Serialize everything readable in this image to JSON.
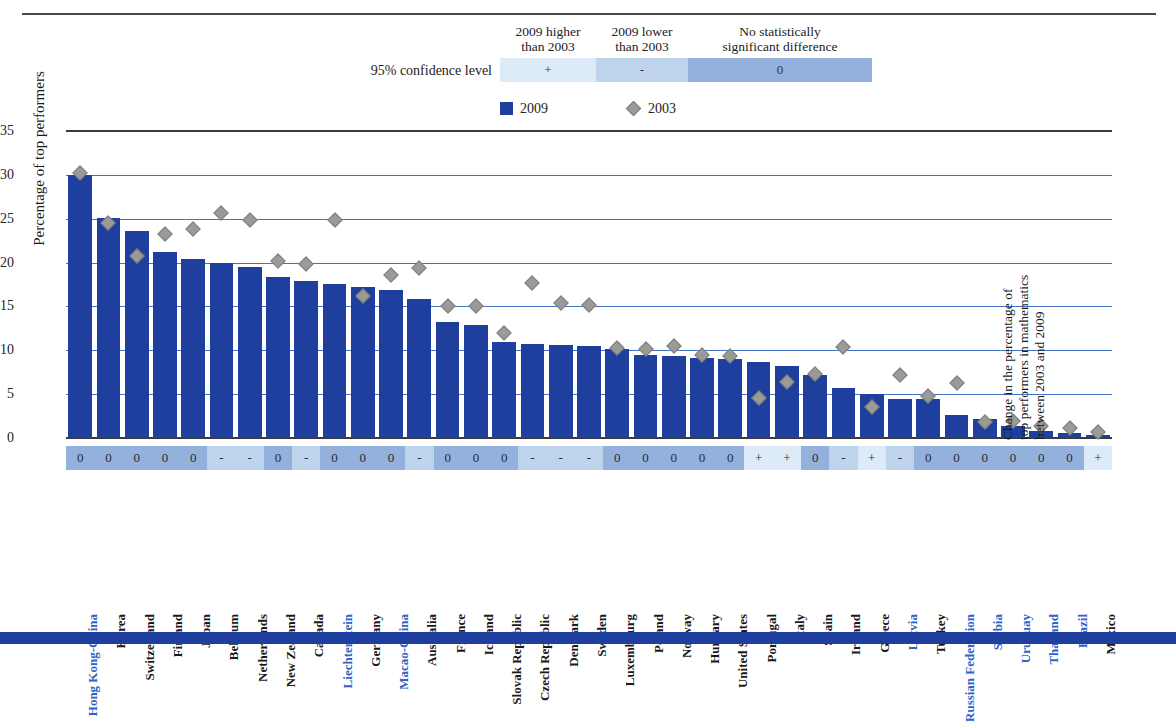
{
  "significance_key": {
    "row_label": "95% confidence level",
    "headers": [
      {
        "line1": "2009 higher",
        "line2": "than 2003"
      },
      {
        "line1": "2009 lower",
        "line2": "than 2003"
      },
      {
        "line1": "No statistically",
        "line2": "significant difference"
      }
    ],
    "bands": [
      {
        "symbol": "+",
        "color": "#dcebf7"
      },
      {
        "symbol": "-",
        "color": "#bed4ec"
      },
      {
        "symbol": "0",
        "color": "#94b0dd"
      }
    ]
  },
  "series_legend": [
    {
      "label": "2009",
      "marker": "square",
      "color": "#1f3f9e"
    },
    {
      "label": "2003",
      "marker": "diamond",
      "color": "#9a9a96"
    }
  ],
  "axes": {
    "y_title": "Percentage of top performers",
    "y_ticks": [
      0,
      5,
      10,
      15,
      20,
      25,
      30,
      35
    ],
    "y_min": 0,
    "y_max": 35,
    "right_title_line1": "Change in the percentage of",
    "right_title_line2": "top performers in mathematics",
    "right_title_line3": "between 2003 and 2009"
  },
  "chart_data": {
    "type": "bar",
    "title": "",
    "xlabel": "",
    "ylabel": "Percentage of top performers",
    "ylim": [
      0,
      35
    ],
    "grid": true,
    "legend_position": "top",
    "categories": [
      "Hong Kong-China",
      "Korea",
      "Switzerland",
      "Finland",
      "Japan",
      "Belgium",
      "Netherlands",
      "New Zealand",
      "Canada",
      "Liechtenstein",
      "Germany",
      "Macao-China",
      "Australia",
      "France",
      "Iceland",
      "Slovak Republic",
      "Czech Republic",
      "Denmark",
      "Sweden",
      "Luxembourg",
      "Poland",
      "Norway",
      "Hungary",
      "United States",
      "Portugal",
      "Italy",
      "Spain",
      "Ireland",
      "Greece",
      "Latvia",
      "Turkey",
      "Russian Federation",
      "Serbia",
      "Uruguay",
      "Thailand",
      "Brazil",
      "Mexico"
    ],
    "highlighted_categories": [
      "Hong Kong-China",
      "Liechtenstein",
      "Macao-China",
      "Latvia",
      "Russian Federation",
      "Serbia",
      "Uruguay",
      "Thailand",
      "Brazil"
    ],
    "series": [
      {
        "name": "2009",
        "marker": "bar",
        "color": "#1f3f9e",
        "values": [
          30.0,
          25.1,
          23.6,
          21.2,
          20.4,
          19.9,
          19.5,
          18.4,
          17.9,
          17.6,
          17.2,
          16.9,
          15.8,
          13.2,
          12.9,
          11.0,
          10.7,
          10.6,
          10.5,
          10.2,
          9.5,
          9.4,
          9.1,
          9.0,
          8.7,
          8.2,
          7.2,
          5.7,
          5.0,
          4.5,
          4.4,
          2.6,
          2.2,
          1.4,
          0.8,
          0.6,
          0.4
        ]
      },
      {
        "name": "2003",
        "marker": "diamond",
        "color": "#9a9a96",
        "values": [
          30.2,
          24.5,
          20.7,
          23.3,
          23.8,
          25.7,
          24.9,
          20.2,
          19.8,
          24.8,
          16.2,
          18.6,
          19.4,
          15.0,
          15.0,
          12.0,
          17.7,
          15.4,
          15.2,
          10.3,
          10.1,
          10.5,
          9.5,
          9.3,
          4.6,
          6.4,
          7.3,
          10.4,
          3.5,
          7.2,
          4.8,
          6.3,
          1.8,
          1.9,
          1.4,
          1.1,
          0.7
        ]
      }
    ],
    "significance": [
      "0",
      "0",
      "0",
      "0",
      "0",
      "-",
      "-",
      "0",
      "-",
      "0",
      "0",
      "0",
      "-",
      "0",
      "0",
      "0",
      "-",
      "-",
      "-",
      "0",
      "0",
      "0",
      "0",
      "0",
      "+",
      "+",
      "0",
      "-",
      "+",
      "-",
      "0",
      "0",
      "0",
      "0",
      "0",
      "0",
      "+"
    ]
  }
}
